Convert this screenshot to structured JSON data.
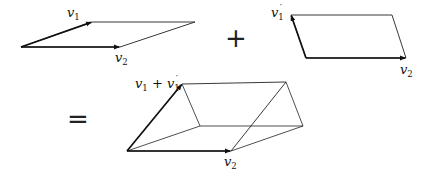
{
  "figure": {
    "operators": {
      "plus": "+",
      "equals": "="
    },
    "shade": {
      "grid_color": "#6e6e6e",
      "line_color": "#222222"
    },
    "panels": [
      {
        "id": "left",
        "labels": {
          "v1": {
            "base": "v",
            "sub": "1",
            "prime": ""
          },
          "v2": {
            "base": "v",
            "sub": "2",
            "prime": ""
          }
        },
        "points": "21,47 92,22 195,22 120,47"
      },
      {
        "id": "right",
        "labels": {
          "v1": {
            "base": "v",
            "sub": "1",
            "prime": "′"
          },
          "v2": {
            "base": "v",
            "sub": "2",
            "prime": ""
          }
        },
        "points": "306,58 291,15 392,15 406,58"
      },
      {
        "id": "sum",
        "labels": {
          "v1": {
            "base": "v",
            "sub": "1",
            "rest": " + v",
            "sub2": "1",
            "prime": "′"
          },
          "v2": {
            "base": "v",
            "sub": "2",
            "prime": ""
          }
        },
        "points": "127,151 182,84 286,82 231,151"
      }
    ]
  }
}
